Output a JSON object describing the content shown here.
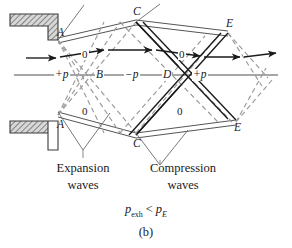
{
  "figure": {
    "caption_label": "(b)",
    "condition": {
      "p_symbol_1": "p",
      "p_sub_1": "exh",
      "relation": "<",
      "p_symbol_2": "p",
      "p_sub_2": "E"
    },
    "wave_region_labels": [
      {
        "line1": "Expansion",
        "line2": "waves"
      },
      {
        "line1": "Compression",
        "line2": "waves"
      }
    ],
    "point_labels": [
      {
        "name": "A",
        "text": "A",
        "x": 57,
        "y": 33
      },
      {
        "name": "A",
        "text": "A",
        "x": 57,
        "y": 125
      },
      {
        "name": "C",
        "text": "C",
        "x": 136,
        "y": 12
      },
      {
        "name": "C",
        "text": "C",
        "x": 136,
        "y": 143
      },
      {
        "name": "E",
        "text": "E",
        "x": 228,
        "y": 25
      },
      {
        "name": "E",
        "text": "E",
        "x": 236,
        "y": 127
      },
      {
        "name": "B",
        "text": "B",
        "x": 98,
        "y": 75
      },
      {
        "name": "D",
        "text": "D",
        "x": 165,
        "y": 75
      }
    ],
    "pressure_labels": [
      {
        "text": "+p",
        "x": 58,
        "y": 75
      },
      {
        "text": "−p",
        "x": 128,
        "y": 75
      },
      {
        "text": "+p",
        "x": 195,
        "y": 75
      }
    ],
    "zero_labels": [
      {
        "text": "0",
        "x": 83,
        "y": 55
      },
      {
        "text": "0",
        "x": 180,
        "y": 55
      },
      {
        "text": "0",
        "x": 83,
        "y": 112
      },
      {
        "text": "0",
        "x": 178,
        "y": 112
      }
    ],
    "colors": {
      "solid_wave": "#1a1a1a",
      "dashed_wave": "#9a9a9a",
      "centerline": "#8a8a8a",
      "streamline": "#555555",
      "wall_fill": "#b8b8b8",
      "wall_edge": "#3a3a3a",
      "background": "#ffffff"
    }
  }
}
